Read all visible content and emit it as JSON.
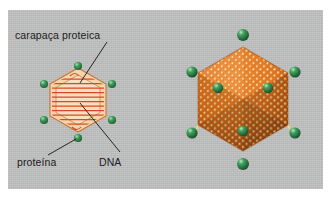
{
  "figure": {
    "kind": "virus-structure-diagram",
    "language": "pt-BR",
    "panel": {
      "background_color": "#bfc0c0",
      "x": 8,
      "y": 10,
      "width": 315,
      "height": 179
    },
    "page_background_color": "#ffffff"
  },
  "labels": {
    "capsid": "carapaça proteica",
    "protein": "proteína",
    "dna": "DNA",
    "text_color": "#1c1c1c",
    "leader_line_color": "#1b1b1b"
  },
  "colors": {
    "capsomere_orange": "#e0701c",
    "capsomere_highlight": "#ffd089",
    "capsid_shell_light": "#f3c8a0",
    "capsid_outline": "#c8762f",
    "dna_strand": "#d84a26",
    "fiber_green": "#2f8a4a",
    "fiber_green_highlight": "#8fd9a0",
    "spike_tan": "#d8c07a"
  },
  "diagram_2d": {
    "name": "cross-section-schematic",
    "center": {
      "x": 78,
      "y": 100
    },
    "hexagon_radius": 30,
    "dna_strand_count": 11,
    "fiber_count": 6,
    "fiber_positions": [
      {
        "x": 78,
        "y": 66
      },
      {
        "x": 44,
        "y": 84
      },
      {
        "x": 112,
        "y": 84
      },
      {
        "x": 44,
        "y": 120
      },
      {
        "x": 112,
        "y": 120
      },
      {
        "x": 78,
        "y": 138
      }
    ]
  },
  "diagram_3d": {
    "name": "icosahedral-capsid-render",
    "center": {
      "x": 243,
      "y": 99
    },
    "radius": 52,
    "capsomere_rows": 15,
    "vertex_fiber_count": 8,
    "vertex_fibers": [
      {
        "x": 243,
        "y": 35,
        "r": 6.0
      },
      {
        "x": 243,
        "y": 164,
        "r": 6.0
      },
      {
        "x": 192,
        "y": 72,
        "r": 5.6
      },
      {
        "x": 295,
        "y": 72,
        "r": 5.6
      },
      {
        "x": 192,
        "y": 133,
        "r": 5.6
      },
      {
        "x": 295,
        "y": 133,
        "r": 5.6
      },
      {
        "x": 218,
        "y": 88,
        "r": 5.2
      },
      {
        "x": 268,
        "y": 88,
        "r": 5.2
      },
      {
        "x": 243,
        "y": 131,
        "r": 5.2
      }
    ]
  },
  "leader_lines": [
    {
      "name": "capsid-leader",
      "from": {
        "x": 107,
        "y": 42
      },
      "to": {
        "x": 80,
        "y": 83
      }
    },
    {
      "name": "protein-leader",
      "from": {
        "x": 48,
        "y": 155
      },
      "to": {
        "x": 76,
        "y": 139
      }
    },
    {
      "name": "dna-leader",
      "from": {
        "x": 120,
        "y": 152
      },
      "to": {
        "x": 80,
        "y": 103
      }
    }
  ]
}
